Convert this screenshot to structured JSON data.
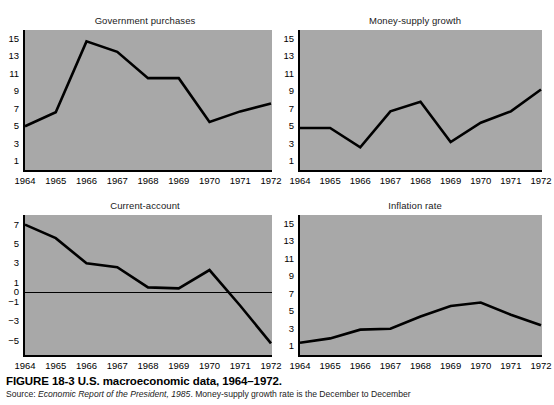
{
  "figure": {
    "caption_title": "FIGURE 18-3  U.S. macroeconomic data, 1964–1972.",
    "source_prefix": "Source: ",
    "source_italic": "Economic Report of the President, 1985",
    "source_suffix": ". Money-supply growth rate is the December to December"
  },
  "chart_data": [
    {
      "type": "line",
      "panel": "top-left",
      "title": "Government purchases\ngrowth rate (percent per year)",
      "title_line1": "Government purchases",
      "title_line2": "growth rate (percent per year)",
      "xlabel": "",
      "ylabel": "percent per year",
      "categories": [
        "1964",
        "1965",
        "1966",
        "1967",
        "1968",
        "1969",
        "1970",
        "1971",
        "1972"
      ],
      "x": [
        1964,
        1965,
        1966,
        1967,
        1968,
        1969,
        1970,
        1971,
        1972
      ],
      "values": [
        5.0,
        6.6,
        14.7,
        13.5,
        10.5,
        10.5,
        5.5,
        6.7,
        7.6
      ],
      "yticks": [
        "15",
        "13",
        "11",
        "9",
        "7",
        "5",
        "3",
        "1"
      ],
      "ytick_values": [
        15,
        13,
        11,
        9,
        7,
        5,
        3,
        1
      ],
      "ylim": [
        0,
        16
      ],
      "grid": false,
      "legend": "none"
    },
    {
      "type": "line",
      "panel": "top-right",
      "title": "Money-supply growth\nrate (percent per year)",
      "title_line1": "Money-supply growth",
      "title_line2": "rate (percent per year)",
      "xlabel": "",
      "ylabel": "percent per year",
      "categories": [
        "1964",
        "1965",
        "1966",
        "1967",
        "1968",
        "1969",
        "1970",
        "1971",
        "1972"
      ],
      "x": [
        1964,
        1965,
        1966,
        1967,
        1968,
        1969,
        1970,
        1971,
        1972
      ],
      "values": [
        4.8,
        4.8,
        2.6,
        6.7,
        7.8,
        3.2,
        5.4,
        6.7,
        9.2
      ],
      "yticks": [
        "15",
        "13",
        "11",
        "9",
        "7",
        "5",
        "3",
        "1"
      ],
      "ytick_values": [
        15,
        13,
        11,
        9,
        7,
        5,
        3,
        1
      ],
      "ylim": [
        0,
        16
      ],
      "grid": false,
      "legend": "none"
    },
    {
      "type": "line",
      "panel": "bottom-left",
      "title": "Current-account\nsurplus ($ billion)",
      "title_line1": "Current-account",
      "title_line2": "surplus ($ billion)",
      "xlabel": "",
      "ylabel": "$ billion",
      "categories": [
        "1964",
        "1965",
        "1966",
        "1967",
        "1968",
        "1969",
        "1970",
        "1971",
        "1972"
      ],
      "x": [
        1964,
        1965,
        1966,
        1967,
        1968,
        1969,
        1970,
        1971,
        1972
      ],
      "values": [
        7.0,
        5.6,
        3.0,
        2.6,
        0.5,
        0.4,
        2.3,
        -1.4,
        -5.3
      ],
      "yticks": [
        "7",
        "5",
        "3",
        "1",
        "0",
        "−1",
        "−3",
        "−5"
      ],
      "ytick_values": [
        7,
        5,
        3,
        1,
        0,
        -1,
        -3,
        -5
      ],
      "ylim": [
        -6.5,
        8.0
      ],
      "zero_line": 0,
      "grid": false,
      "legend": "none"
    },
    {
      "type": "line",
      "panel": "bottom-right",
      "title": "Inflation rate\n(percent per year)",
      "title_line1": "Inflation rate",
      "title_line2": "(percent per year)",
      "xlabel": "",
      "ylabel": "percent per year",
      "categories": [
        "1964",
        "1965",
        "1966",
        "1967",
        "1968",
        "1969",
        "1970",
        "1971",
        "1972"
      ],
      "x": [
        1964,
        1965,
        1966,
        1967,
        1968,
        1969,
        1970,
        1971,
        1972
      ],
      "values": [
        1.4,
        1.9,
        2.9,
        3.0,
        4.4,
        5.6,
        6.0,
        4.6,
        3.4
      ],
      "yticks": [
        "15",
        "13",
        "11",
        "9",
        "7",
        "5",
        "3",
        "1"
      ],
      "ytick_values": [
        15,
        13,
        11,
        9,
        7,
        5,
        3,
        1
      ],
      "ylim": [
        0,
        16
      ],
      "grid": false,
      "legend": "none"
    }
  ],
  "colors": {
    "plot_background": "#a8a8a8",
    "line": "#000000",
    "page_background": "#ffffff",
    "text": "#000000"
  }
}
